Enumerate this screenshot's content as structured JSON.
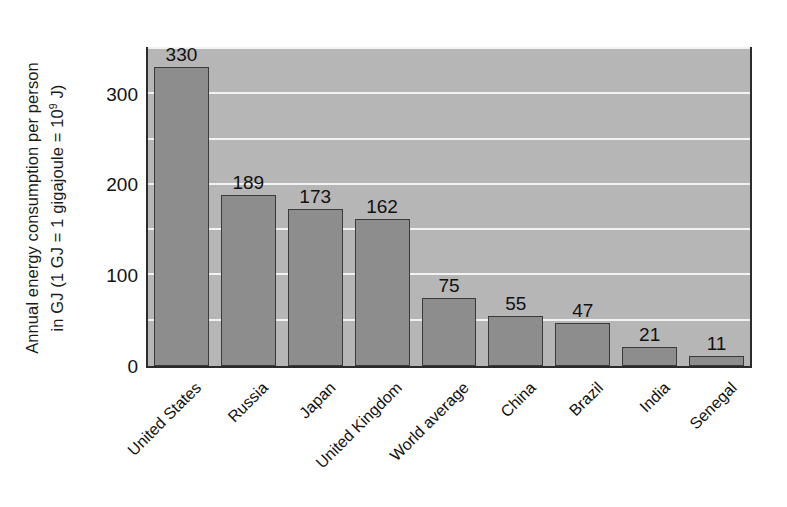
{
  "chart_data": {
    "type": "bar",
    "title": "",
    "subtitle": "",
    "xlabel": "",
    "ylabel_line1": "Annual energy consumption per person",
    "ylabel_line2_pre": "in GJ (1 GJ = 1 gigajoule = 10",
    "ylabel_line2_sup": "9",
    "ylabel_line2_post": " J)",
    "ylabel_full": "Annual energy consumption per person in GJ (1 GJ = 1 gigajoule = 10^9 J)",
    "categories": [
      "United States",
      "Russia",
      "Japan",
      "United Kingdom",
      "World average",
      "China",
      "Brazil",
      "India",
      "Senegal"
    ],
    "values": [
      330,
      189,
      173,
      162,
      75,
      55,
      47,
      21,
      11
    ],
    "value_labels": [
      "330",
      "189",
      "173",
      "162",
      "75",
      "55",
      "47",
      "21",
      "11"
    ],
    "ylim": [
      0,
      350
    ],
    "ytick_values": [
      0,
      100,
      200,
      300
    ],
    "ytick_labels": [
      "0",
      "100",
      "200",
      "300"
    ],
    "gridline_values": [
      50,
      100,
      150,
      200,
      250,
      300,
      350
    ],
    "grid": true,
    "grid_color": "#f2f2f2",
    "legend": "none",
    "unit": "GJ",
    "colors": {
      "bar_fill": "#8d8d8d",
      "bar_edge": "#3a3a3a",
      "plot_background": "#b6b6b6",
      "frame": "#2b2b2b",
      "page_background": "#ffffff",
      "text": "#111111"
    }
  }
}
